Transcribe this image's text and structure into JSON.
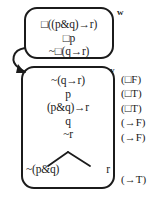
{
  "diagram": {
    "type": "modal-logic-tableau",
    "worlds": [
      {
        "label": "w",
        "formulas": [
          "□((p&q)→r)",
          "□p",
          "~□(q→r)"
        ]
      },
      {
        "label": "v",
        "formulas": [
          "~(q→r)",
          "p",
          "(p&q)→r",
          "q",
          "~r"
        ],
        "branch": {
          "left": "~(p&q)",
          "right": "r"
        }
      }
    ],
    "annotations": [
      "(□F)",
      "(□T)",
      "(□T)",
      "(→F)",
      "(→F)",
      "(→T)"
    ],
    "accessibility_arrow": "curved-arrow-w-to-v",
    "colors": {
      "ink": "#1b1b1b",
      "background": "#ffffff"
    }
  }
}
